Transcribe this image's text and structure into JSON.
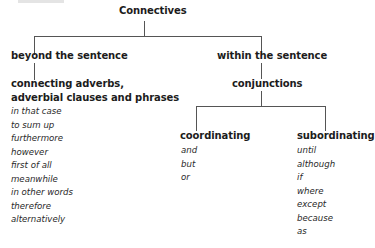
{
  "diagram": {
    "root": {
      "label": "Connectives"
    },
    "branches": [
      {
        "label": "beyond the sentence",
        "child": {
          "label_line1": "connecting adverbs,",
          "label_line2": "adverbial clauses and  phrases",
          "items": [
            "in that case",
            "to sum up",
            "furthermore",
            "however",
            "first of all",
            "meanwhile",
            "in other words",
            "therefore",
            "alternatively"
          ]
        }
      },
      {
        "label": "within the sentence",
        "child": {
          "label": "conjunctions",
          "children": [
            {
              "label": "coordinating",
              "items": [
                "and",
                "but",
                "or"
              ]
            },
            {
              "label": "subordinating",
              "items": [
                "until",
                "although",
                "if",
                "where",
                "except",
                "because",
                "as"
              ]
            }
          ]
        }
      }
    ],
    "line_color": "#555555"
  }
}
